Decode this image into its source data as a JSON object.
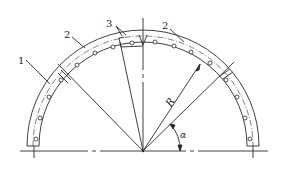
{
  "diagram": {
    "type": "semicircular ring segment (arch) cross-section",
    "labels": {
      "part_1": "1",
      "part_2_left": "2",
      "part_2_right": "2",
      "part_3": "3",
      "radius": "R",
      "angle": "α"
    },
    "geometry": {
      "center": [
        143,
        151
      ],
      "outer_radius": 116,
      "inner_radius": 104,
      "hole_circle_radius": 110,
      "ground_line_y": 151
    },
    "colors": {
      "line": "#2a2a2a",
      "background": "#ffffff"
    }
  }
}
